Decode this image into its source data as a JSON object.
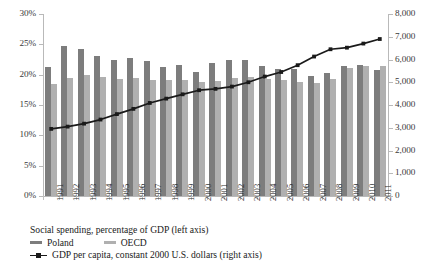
{
  "chart_data": {
    "type": "bar",
    "title": "",
    "subtitle": "",
    "xlabel": "",
    "ylabel_left": "",
    "ylabel_right": "",
    "grid": false,
    "legend_position": "bottom",
    "categories": [
      "1991",
      "1992",
      "1993",
      "1994",
      "1995",
      "1996",
      "1997",
      "1998",
      "1999",
      "2000",
      "2001",
      "2002",
      "2003",
      "2004",
      "2005",
      "2006",
      "2007",
      "2008",
      "2009",
      "2010",
      "2011"
    ],
    "left_axis": {
      "min": 0,
      "max": 30,
      "step": 5,
      "unit": "%",
      "ticks": [
        "0%",
        "5%",
        "10%",
        "15%",
        "20%",
        "25%",
        "30%"
      ]
    },
    "right_axis": {
      "min": 0,
      "max": 8000,
      "step": 1000,
      "unit": "",
      "ticks": [
        "0",
        "1,000",
        "2,000",
        "3,000",
        "4,000",
        "5,000",
        "6,000",
        "7,000",
        "8,000"
      ]
    },
    "series": [
      {
        "name": "Poland",
        "type": "bar",
        "axis": "left",
        "color": "#7d7d7d",
        "values": [
          21.2,
          24.8,
          24.3,
          23.1,
          22.5,
          22.8,
          22.2,
          21.3,
          21.6,
          20.4,
          22.0,
          22.5,
          22.5,
          21.5,
          21.0,
          20.9,
          19.8,
          20.2,
          21.5,
          21.6,
          20.8
        ]
      },
      {
        "name": "OECD",
        "type": "bar",
        "axis": "left",
        "color": "#b0b0b0",
        "values": [
          18.5,
          19.4,
          19.9,
          19.6,
          19.3,
          19.4,
          19.1,
          19.1,
          19.1,
          18.8,
          19.0,
          19.4,
          19.6,
          19.3,
          19.2,
          18.8,
          18.6,
          19.3,
          21.1,
          21.5,
          21.4
        ]
      },
      {
        "name": "GDP per capita, constant 2000 U.S. dollars (right axis)",
        "type": "line",
        "axis": "right",
        "color": "#1a1a1a",
        "marker": "square",
        "values": [
          2950,
          3050,
          3180,
          3360,
          3600,
          3830,
          4090,
          4280,
          4470,
          4650,
          4710,
          4810,
          5000,
          5250,
          5450,
          5750,
          6130,
          6450,
          6520,
          6700,
          6900
        ]
      }
    ],
    "legend": {
      "title": "Social spending, percentage of GDP (left axis)",
      "entries": [
        {
          "label": "Poland",
          "marker": "bar-swatch",
          "color": "#7d7d7d"
        },
        {
          "label": "OECD",
          "marker": "bar-swatch",
          "color": "#b0b0b0"
        },
        {
          "label": "GDP per capita, constant 2000 U.S. dollars (right axis)",
          "marker": "line-square",
          "color": "#1a1a1a"
        }
      ]
    }
  }
}
